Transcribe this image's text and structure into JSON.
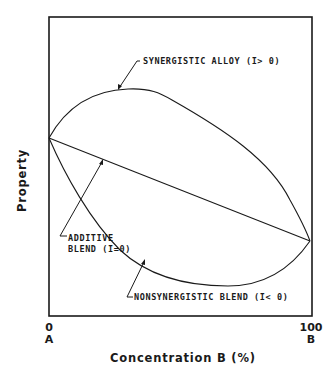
{
  "diagram": {
    "type": "property-vs-composition schematic",
    "y_axis_label": "Property",
    "x_axis_label": "Concentration B (%)",
    "x_ticks": [
      {
        "value": "0",
        "component": "A"
      },
      {
        "value": "100",
        "component": "B"
      }
    ],
    "curves": [
      {
        "id": "synergistic",
        "label": "SYNERGISTIC ALLOY (I> 0)",
        "shape": "convex arc above the straight line, max near ~25% B"
      },
      {
        "id": "additive",
        "label_line1": "ADDITIVE",
        "label_line2": "BLEND (I=0)",
        "shape": "straight line from A to B"
      },
      {
        "id": "nonsynergistic",
        "label": "NONSYNERGISTIC BLEND (I< 0)",
        "shape": "concave arc below the straight line, min near ~70% B"
      }
    ],
    "colors": {
      "line": "#1a1a1a",
      "background": "#ffffff"
    }
  }
}
